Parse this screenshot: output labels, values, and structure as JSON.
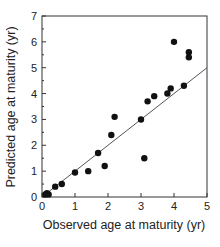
{
  "chart_data": {
    "type": "scatter",
    "title": "",
    "xlabel": "Observed age at maturity (yr)",
    "ylabel": "Predicted age at maturity (yr)",
    "xlim": [
      0,
      5
    ],
    "ylim": [
      0,
      7
    ],
    "xticks": [
      0,
      1,
      2,
      3,
      4,
      5
    ],
    "yticks": [
      0,
      1,
      2,
      3,
      4,
      5,
      6,
      7
    ],
    "grid": false,
    "legend": null,
    "series": [
      {
        "name": "observations",
        "marker": "filled-circle",
        "color": "#111111",
        "points": [
          {
            "x": 0.1,
            "y": 0.1
          },
          {
            "x": 0.15,
            "y": 0.15
          },
          {
            "x": 0.2,
            "y": 0.1
          },
          {
            "x": 0.4,
            "y": 0.4
          },
          {
            "x": 0.6,
            "y": 0.5
          },
          {
            "x": 1.0,
            "y": 0.95
          },
          {
            "x": 1.4,
            "y": 1.0
          },
          {
            "x": 1.7,
            "y": 1.7
          },
          {
            "x": 1.9,
            "y": 1.2
          },
          {
            "x": 2.1,
            "y": 2.4
          },
          {
            "x": 2.2,
            "y": 3.1
          },
          {
            "x": 3.0,
            "y": 3.0
          },
          {
            "x": 3.1,
            "y": 1.5
          },
          {
            "x": 3.2,
            "y": 3.7
          },
          {
            "x": 3.4,
            "y": 3.9
          },
          {
            "x": 3.8,
            "y": 4.0
          },
          {
            "x": 3.9,
            "y": 4.2
          },
          {
            "x": 4.0,
            "y": 6.0
          },
          {
            "x": 4.3,
            "y": 4.3
          },
          {
            "x": 4.45,
            "y": 5.6
          },
          {
            "x": 4.45,
            "y": 5.4
          }
        ]
      },
      {
        "name": "fit line",
        "type": "line",
        "color": "#555555",
        "points": [
          {
            "x": 0.1,
            "y": 0.1
          },
          {
            "x": 5.0,
            "y": 5.0
          }
        ]
      }
    ]
  }
}
